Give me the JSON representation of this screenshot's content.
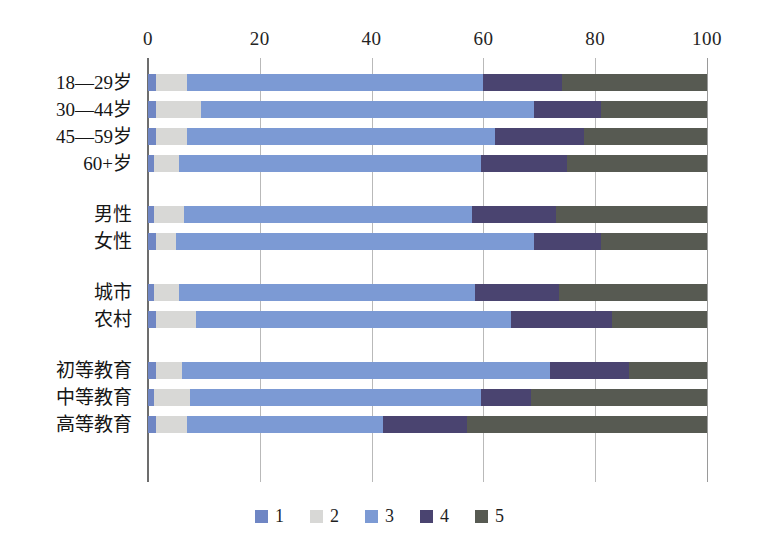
{
  "chart_data": {
    "type": "bar",
    "orientation": "horizontal",
    "stacked": true,
    "stack_mode": "percent",
    "title": "",
    "subtitle": "",
    "xlabel": "",
    "ylabel": "",
    "xlim": [
      0,
      100
    ],
    "xticks": [
      0,
      20,
      40,
      60,
      80,
      100
    ],
    "xtick_labels": [
      "0",
      "20",
      "40",
      "60",
      "80",
      "100"
    ],
    "grid": true,
    "grid_axis": "x",
    "legend_position": "bottom",
    "legend_entries": [
      "1",
      "2",
      "3",
      "4",
      "5"
    ],
    "series_colors": [
      "#6f86c4",
      "#d8d8d6",
      "#7c9ad4",
      "#4a4470",
      "#575a52"
    ],
    "categories": [
      "18—29岁",
      "30—44岁",
      "45—59岁",
      "60+岁",
      "男性",
      "女性",
      "城市",
      "农村",
      "初等教育",
      "中等教育",
      "高等教育"
    ],
    "category_groups": [
      {
        "name": "age",
        "categories": [
          "18—29岁",
          "30—44岁",
          "45—59岁",
          "60+岁"
        ]
      },
      {
        "name": "gender",
        "categories": [
          "男性",
          "女性"
        ]
      },
      {
        "name": "settlement",
        "categories": [
          "城市",
          "农村"
        ]
      },
      {
        "name": "education",
        "categories": [
          "初等教育",
          "中等教育",
          "高等教育"
        ]
      }
    ],
    "series": [
      {
        "name": "1",
        "values": [
          1.5,
          1.5,
          1.5,
          1.0,
          1.0,
          1.5,
          1.0,
          1.5,
          1.5,
          1.0,
          1.5
        ]
      },
      {
        "name": "2",
        "values": [
          5.5,
          8.0,
          5.5,
          4.5,
          5.5,
          3.5,
          4.5,
          7.0,
          4.5,
          6.5,
          5.5
        ]
      },
      {
        "name": "3",
        "values": [
          53.0,
          59.5,
          55.0,
          54.0,
          51.5,
          64.0,
          53.0,
          56.5,
          66.0,
          52.0,
          35.0
        ]
      },
      {
        "name": "4",
        "values": [
          14.0,
          12.0,
          16.0,
          15.5,
          15.0,
          12.0,
          15.0,
          18.0,
          14.0,
          9.0,
          15.0
        ]
      },
      {
        "name": "5",
        "values": [
          26.0,
          19.0,
          22.0,
          25.0,
          27.0,
          19.0,
          26.5,
          17.0,
          14.0,
          31.5,
          43.0
        ]
      }
    ],
    "rows": [
      {
        "category": "18—29岁",
        "values": [
          1.5,
          5.5,
          53.0,
          14.0,
          26.0
        ],
        "cumulative": [
          1.5,
          7.0,
          60.0,
          74.0,
          100.0
        ]
      },
      {
        "category": "30—44岁",
        "values": [
          1.5,
          8.0,
          59.5,
          12.0,
          19.0
        ],
        "cumulative": [
          1.5,
          9.5,
          69.0,
          81.0,
          100.0
        ]
      },
      {
        "category": "45—59岁",
        "values": [
          1.5,
          5.5,
          55.0,
          16.0,
          22.0
        ],
        "cumulative": [
          1.5,
          7.0,
          62.0,
          78.0,
          100.0
        ]
      },
      {
        "category": "60+岁",
        "values": [
          1.0,
          4.5,
          54.0,
          15.5,
          25.0
        ],
        "cumulative": [
          1.0,
          5.5,
          59.5,
          75.0,
          100.0
        ]
      },
      {
        "category": "男性",
        "values": [
          1.0,
          5.5,
          51.5,
          15.0,
          27.0
        ],
        "cumulative": [
          1.0,
          6.5,
          58.0,
          73.0,
          100.0
        ]
      },
      {
        "category": "女性",
        "values": [
          1.5,
          3.5,
          64.0,
          12.0,
          19.0
        ],
        "cumulative": [
          1.5,
          5.0,
          69.0,
          81.0,
          100.0
        ]
      },
      {
        "category": "城市",
        "values": [
          1.0,
          4.5,
          53.0,
          15.0,
          26.5
        ],
        "cumulative": [
          1.0,
          5.5,
          58.5,
          73.5,
          100.0
        ]
      },
      {
        "category": "农村",
        "values": [
          1.5,
          7.0,
          56.5,
          18.0,
          17.0
        ],
        "cumulative": [
          1.5,
          8.5,
          65.0,
          83.0,
          100.0
        ]
      },
      {
        "category": "初等教育",
        "values": [
          1.5,
          4.5,
          66.0,
          14.0,
          14.0
        ],
        "cumulative": [
          1.5,
          6.0,
          72.0,
          86.0,
          100.0
        ]
      },
      {
        "category": "中等教育",
        "values": [
          1.0,
          6.5,
          52.0,
          9.0,
          31.5
        ],
        "cumulative": [
          1.0,
          7.5,
          59.5,
          68.5,
          100.0
        ]
      },
      {
        "category": "高等教育",
        "values": [
          1.5,
          5.5,
          35.0,
          15.0,
          43.0
        ],
        "cumulative": [
          1.5,
          7.0,
          42.0,
          57.0,
          100.0
        ]
      }
    ]
  },
  "legend": {
    "items": [
      {
        "label": "1",
        "color": "#6f86c4"
      },
      {
        "label": "2",
        "color": "#d8d8d6"
      },
      {
        "label": "3",
        "color": "#7c9ad4"
      },
      {
        "label": "4",
        "color": "#4a4470"
      },
      {
        "label": "5",
        "color": "#575a52"
      }
    ]
  },
  "axis": {
    "x_tick_labels": [
      "0",
      "20",
      "40",
      "60",
      "80",
      "100"
    ]
  }
}
